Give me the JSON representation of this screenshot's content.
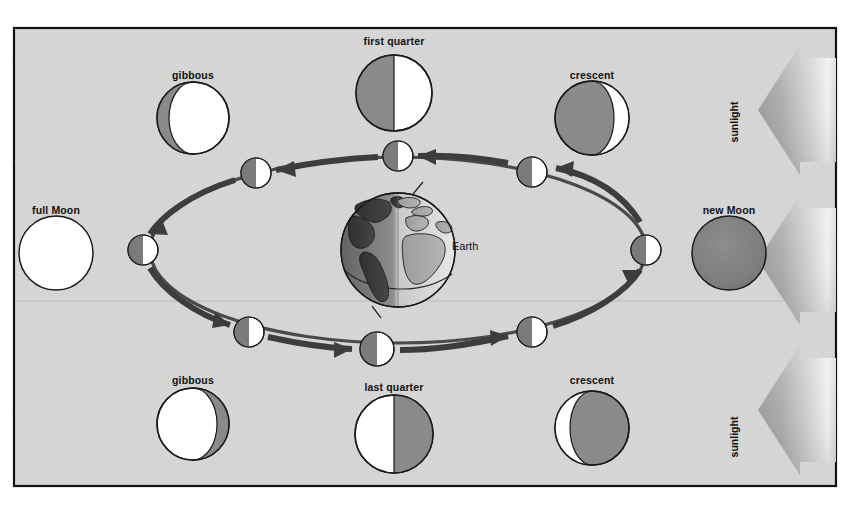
{
  "figure": {
    "frame": {
      "border_color": "#121212",
      "background_color": "#d5d5d5",
      "outer_background": "#ffffff",
      "x": 14,
      "y": 28,
      "width": 822,
      "height": 458
    },
    "colors": {
      "lit_side": "#ffffff",
      "dark_side": "#7b7b7b",
      "dark_side_deep": "#6f6f6f",
      "outline": "#1a1a1a",
      "orbit": "#4a4a4a",
      "arrow": "#3d3d3d",
      "earth_land_dark": "#4a4a4a",
      "earth_ocean_light": "#bdbdbd",
      "sunbeam_light": "#e2e2e2",
      "sunbeam_dark": "#8d8d8d",
      "label_text": "#111111"
    },
    "earth": {
      "label": "Earth",
      "cx": 398,
      "cy": 250,
      "r": 57,
      "label_x": 452,
      "label_y": 245
    },
    "orbit": {
      "cx": 398,
      "cy": 250,
      "rx": 248,
      "ry": 93,
      "direction": "counterclockwise"
    },
    "sunlight_beams": [
      {
        "name": "sunlight-beam-top",
        "label": "sunlight",
        "label_x": 734,
        "label_y": 122,
        "y": 55
      },
      {
        "name": "sunlight-beam-middle",
        "label": "",
        "label_x": 0,
        "label_y": 0,
        "y": 205
      },
      {
        "name": "sunlight-beam-bottom",
        "label": "sunlight",
        "label_x": 734,
        "label_y": 437,
        "y": 355
      }
    ],
    "orbit_moons": [
      {
        "name": "orbit-moon-new",
        "cx": 646,
        "cy": 250,
        "r": 15,
        "phase": "half-lit-right"
      },
      {
        "name": "orbit-moon-waxing-cres",
        "cx": 532,
        "cy": 172,
        "r": 15,
        "phase": "half-lit-right"
      },
      {
        "name": "orbit-moon-first-quarter",
        "cx": 398,
        "cy": 156,
        "r": 15,
        "phase": "half-lit-right"
      },
      {
        "name": "orbit-moon-waxing-gib",
        "cx": 256,
        "cy": 173,
        "r": 15,
        "phase": "half-lit-right"
      },
      {
        "name": "orbit-moon-full",
        "cx": 143,
        "cy": 250,
        "r": 15,
        "phase": "half-lit-right"
      },
      {
        "name": "orbit-moon-waning-gib",
        "cx": 249,
        "cy": 332,
        "r": 15,
        "phase": "half-lit-right"
      },
      {
        "name": "orbit-moon-last-quarter",
        "cx": 377,
        "cy": 349,
        "r": 17,
        "phase": "half-lit-right"
      },
      {
        "name": "orbit-moon-waning-cres",
        "cx": 532,
        "cy": 332,
        "r": 15,
        "phase": "half-lit-right"
      }
    ],
    "phase_moons": [
      {
        "name": "phase-moon-full",
        "label": "full Moon",
        "label_x": 56,
        "label_y": 210,
        "cx": 56,
        "cy": 253,
        "r": 37,
        "phase": "full",
        "lit_fraction": 1.0
      },
      {
        "name": "phase-moon-waxing-gibbous",
        "label": "gibbous",
        "label_x": 193,
        "label_y": 76,
        "cx": 193,
        "cy": 118,
        "r": 36,
        "phase": "waxing-gibbous",
        "lit_fraction": 0.82,
        "shadow_side": "left"
      },
      {
        "name": "phase-moon-first-quarter",
        "label": "first quarter",
        "label_x": 394,
        "label_y": 42,
        "cx": 394,
        "cy": 93,
        "r": 38,
        "phase": "first-quarter",
        "lit_fraction": 0.5,
        "shadow_side": "left"
      },
      {
        "name": "phase-moon-waxing-crescent",
        "label": "crescent",
        "label_x": 592,
        "label_y": 76,
        "cx": 592,
        "cy": 118,
        "r": 37,
        "phase": "waxing-crescent",
        "lit_fraction": 0.2,
        "shadow_side": "left"
      },
      {
        "name": "phase-moon-new",
        "label": "new Moon",
        "label_x": 729,
        "label_y": 211,
        "cx": 729,
        "cy": 253,
        "r": 37,
        "phase": "new",
        "lit_fraction": 0.0
      },
      {
        "name": "phase-moon-waning-crescent",
        "label": "crescent",
        "label_x": 592,
        "label_y": 381,
        "cx": 592,
        "cy": 428,
        "r": 37,
        "phase": "waning-crescent",
        "lit_fraction": 0.2,
        "shadow_side": "right"
      },
      {
        "name": "phase-moon-last-quarter",
        "label": "last quarter",
        "label_x": 394,
        "label_y": 388,
        "cx": 394,
        "cy": 434,
        "r": 39,
        "phase": "last-quarter",
        "lit_fraction": 0.5,
        "shadow_side": "right"
      },
      {
        "name": "phase-moon-waning-gibbous",
        "label": "gibbous",
        "label_x": 193,
        "label_y": 381,
        "cx": 193,
        "cy": 424,
        "r": 36,
        "phase": "waning-gibbous",
        "lit_fraction": 0.82,
        "shadow_side": "right"
      }
    ]
  }
}
